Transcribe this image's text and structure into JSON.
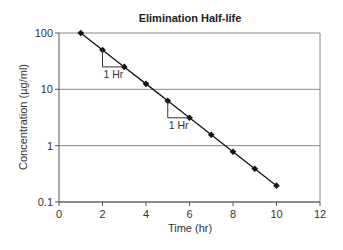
{
  "chart_data": {
    "type": "line",
    "title": "Elimination Half-life",
    "xlabel": "Time (hr)",
    "ylabel": "Concentration (µg/ml)",
    "x": [
      1,
      2,
      3,
      4,
      5,
      6,
      7,
      8,
      9,
      10
    ],
    "series": [
      {
        "name": "Concentration",
        "values": [
          100,
          50,
          25,
          12.5,
          6.25,
          3.125,
          1.5625,
          0.78,
          0.39,
          0.195
        ]
      }
    ],
    "xlim": [
      0,
      12
    ],
    "ylim": [
      0.1,
      100
    ],
    "yscale": "log",
    "xticks": [
      "0",
      "2",
      "4",
      "6",
      "8",
      "10",
      "12"
    ],
    "yticks": [
      "0.1",
      "1",
      "10",
      "100"
    ],
    "grid": "horizontal at decades",
    "annotations": [
      {
        "text": "1 Hr",
        "x_from": 2,
        "x_to": 3
      },
      {
        "text": "1 Hr",
        "x_from": 5,
        "x_to": 6
      }
    ],
    "colors": {
      "line": "#111111",
      "grid": "#888888",
      "axis": "#555555"
    }
  }
}
